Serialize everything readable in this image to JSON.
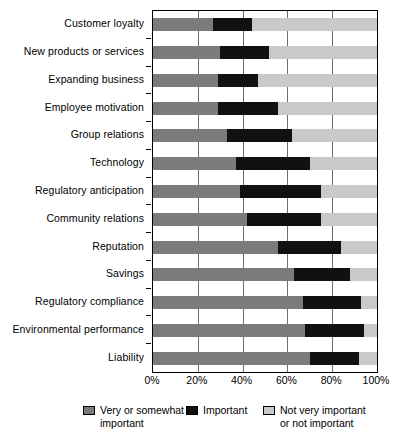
{
  "chart_data": {
    "type": "bar",
    "orientation": "horizontal",
    "stacked": true,
    "title": "",
    "subtitle": "",
    "xlabel": "",
    "ylabel": "",
    "xlim": [
      0,
      100
    ],
    "xticks": [
      "0%",
      "20%",
      "40%",
      "60%",
      "80%",
      "100%"
    ],
    "xtick_values": [
      0,
      20,
      40,
      60,
      80,
      100
    ],
    "grid": true,
    "grid_axis": "x",
    "legend_position": "bottom",
    "units": "percent",
    "categories": [
      "Customer loyalty",
      "New products or services",
      "Expanding business",
      "Employee motivation",
      "Group relations",
      "Technology",
      "Regulatory anticipation",
      "Community relations",
      "Reputation",
      "Savings",
      "Regulatory compliance",
      "Environmental performance",
      "Liability"
    ],
    "series": [
      {
        "name": "Very or somewhat important",
        "color": "#7b7b7b",
        "values": [
          27,
          30,
          29,
          29,
          33,
          37,
          39,
          42,
          56,
          63,
          67,
          68,
          70
        ]
      },
      {
        "name": "Important",
        "color": "#111111",
        "values": [
          17,
          22,
          18,
          27,
          29,
          33,
          36,
          33,
          28,
          25,
          26,
          26,
          22
        ]
      },
      {
        "name": "Not very important or not important",
        "color": "#c9c9c9",
        "values": [
          56,
          48,
          53,
          44,
          38,
          30,
          25,
          25,
          16,
          12,
          7,
          6,
          8
        ]
      }
    ]
  },
  "legend": {
    "items": [
      {
        "label": "Very or somewhat\nimportant",
        "swatch": "very-swatch"
      },
      {
        "label": "Important",
        "swatch": "important-swatch"
      },
      {
        "label": "Not very important\nor not important",
        "swatch": "not-important-swatch"
      }
    ]
  }
}
